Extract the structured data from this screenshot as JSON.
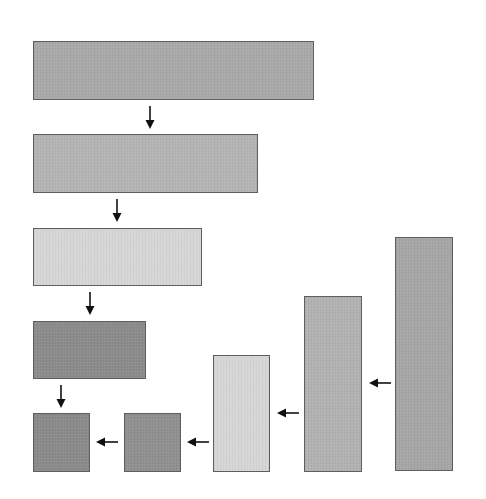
{
  "diagram": {
    "boxes": [
      {
        "id": "box-1",
        "shade": "medium",
        "color": "#a9a9a9",
        "x": 33,
        "y": 41,
        "w": 281,
        "h": 59
      },
      {
        "id": "box-2",
        "shade": "medium-light",
        "color": "#b4b4b4",
        "x": 33,
        "y": 134,
        "w": 225,
        "h": 59
      },
      {
        "id": "box-3",
        "shade": "light",
        "color": "#d6d6d6",
        "x": 33,
        "y": 228,
        "w": 169,
        "h": 58
      },
      {
        "id": "box-4",
        "shade": "dark",
        "color": "#8b8b8b",
        "x": 33,
        "y": 321,
        "w": 113,
        "h": 58
      },
      {
        "id": "box-5",
        "shade": "dark",
        "color": "#8a8a8a",
        "x": 33,
        "y": 413,
        "w": 57,
        "h": 59
      },
      {
        "id": "box-6",
        "shade": "dark",
        "color": "#909090",
        "x": 124,
        "y": 413,
        "w": 57,
        "h": 59
      },
      {
        "id": "box-7",
        "shade": "light",
        "color": "#d6d6d6",
        "x": 213,
        "y": 355,
        "w": 57,
        "h": 117
      },
      {
        "id": "box-8",
        "shade": "medium-light",
        "color": "#b2b2b2",
        "x": 304,
        "y": 296,
        "w": 58,
        "h": 176
      },
      {
        "id": "box-9",
        "shade": "medium",
        "color": "#a6a6a6",
        "x": 395,
        "y": 237,
        "w": 58,
        "h": 234
      }
    ],
    "arrows": [
      {
        "id": "arrow-1",
        "direction": "down",
        "x": 150,
        "y": 106,
        "length": 23
      },
      {
        "id": "arrow-2",
        "direction": "down",
        "x": 117,
        "y": 199,
        "length": 23
      },
      {
        "id": "arrow-3",
        "direction": "down",
        "x": 90,
        "y": 292,
        "length": 23
      },
      {
        "id": "arrow-4",
        "direction": "down",
        "x": 61,
        "y": 385,
        "length": 23
      },
      {
        "id": "arrow-5",
        "direction": "left",
        "x": 96,
        "y": 442,
        "length": 22
      },
      {
        "id": "arrow-6",
        "direction": "left",
        "x": 187,
        "y": 442,
        "length": 22
      },
      {
        "id": "arrow-7",
        "direction": "left",
        "x": 277,
        "y": 413,
        "length": 22
      },
      {
        "id": "arrow-8",
        "direction": "left",
        "x": 369,
        "y": 383,
        "length": 22
      }
    ],
    "arrow_color": "#111111"
  }
}
